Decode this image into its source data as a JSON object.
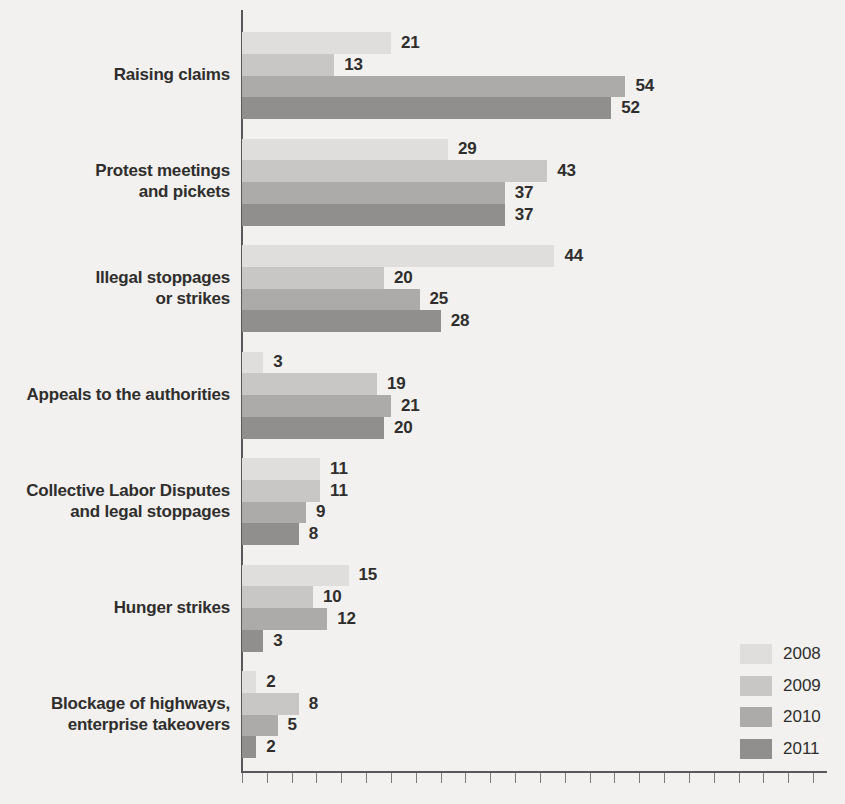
{
  "chart_data": {
    "type": "bar",
    "orientation": "horizontal",
    "title": "",
    "xlabel": "",
    "ylabel": "",
    "xlim": [
      0,
      84
    ],
    "grid": false,
    "value_labels": true,
    "legend_position": "bottom-right",
    "categories": [
      "Raising claims",
      "Protest meetings and pickets",
      "Illegal stoppages or strikes",
      "Appeals to the authorities",
      "Collective Labor Disputes and legal stoppages",
      "Hunger strikes",
      "Blockage of highways, enterprise takeovers"
    ],
    "category_display_lines": [
      "Raising claims",
      "Protest meetings\nand pickets",
      "Illegal stoppages\nor strikes",
      "Appeals to the authorities",
      "Collective Labor Disputes\nand legal stoppages",
      "Hunger strikes",
      "Blockage of highways,\nenterprise takeovers"
    ],
    "series": [
      {
        "name": "2008",
        "color": "#dfdedd",
        "values": [
          21,
          29,
          44,
          3,
          11,
          15,
          2
        ]
      },
      {
        "name": "2009",
        "color": "#c8c7c5",
        "values": [
          13,
          43,
          20,
          19,
          11,
          10,
          8
        ]
      },
      {
        "name": "2010",
        "color": "#acaba9",
        "values": [
          54,
          37,
          25,
          21,
          9,
          12,
          5
        ]
      },
      {
        "name": "2011",
        "color": "#908f8d",
        "values": [
          52,
          37,
          28,
          20,
          8,
          3,
          2
        ]
      }
    ]
  },
  "style": {
    "background_color": "#f2f1ef",
    "text_color": "#2f2e2c",
    "axis_color": "#58585a",
    "tick_color": "#7b7b7b"
  }
}
